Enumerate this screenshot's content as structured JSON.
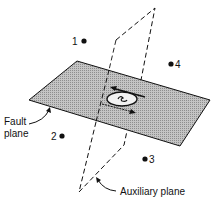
{
  "diagram": {
    "labels": {
      "fault_plane_line1": "Fault",
      "fault_plane_line2": "plane",
      "auxiliary_plane": "Auxiliary plane"
    },
    "points": [
      {
        "id": "1",
        "label": "1"
      },
      {
        "id": "2",
        "label": "2"
      },
      {
        "id": "3",
        "label": "3"
      },
      {
        "id": "4",
        "label": "4"
      }
    ],
    "colors": {
      "fault_plane_fill": "#b8b8b8",
      "line": "#111111",
      "background": "#ffffff"
    }
  }
}
